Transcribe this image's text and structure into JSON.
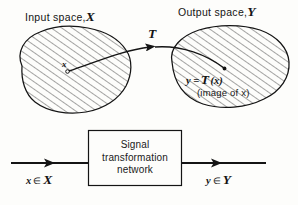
{
  "figure": {
    "type": "signal-transformation-mapping-diagram",
    "background_color": "#fdfdfb",
    "ink_color": "#141414"
  },
  "upper_panel": {
    "input_space": {
      "title_prefix": "Input space,",
      "symbol": "ℬ",
      "symbol_text": "X",
      "shape": "hatched-blob",
      "point_label": "x"
    },
    "output_space": {
      "title_prefix": "Output space,",
      "symbol_text": "Y",
      "shape": "hatched-oval",
      "equation": "y = ℳ(x)",
      "equation_lhs": "y =",
      "equation_operator": "T",
      "equation_arg": "(x)",
      "caption": "(image of x)"
    },
    "mapping_arrow": {
      "operator_label": "T",
      "description": "curved arrow from point x to its image"
    }
  },
  "lower_panel": {
    "block": {
      "lines": [
        "Signal",
        "transformation",
        "network"
      ],
      "line1": "Signal",
      "line2": "transformation",
      "line3": "network"
    },
    "input_flow": {
      "label_var": "x",
      "label_member": "∈",
      "label_set": "X"
    },
    "output_flow": {
      "label_var": "y",
      "label_member": "∈",
      "label_set": "Y"
    }
  }
}
